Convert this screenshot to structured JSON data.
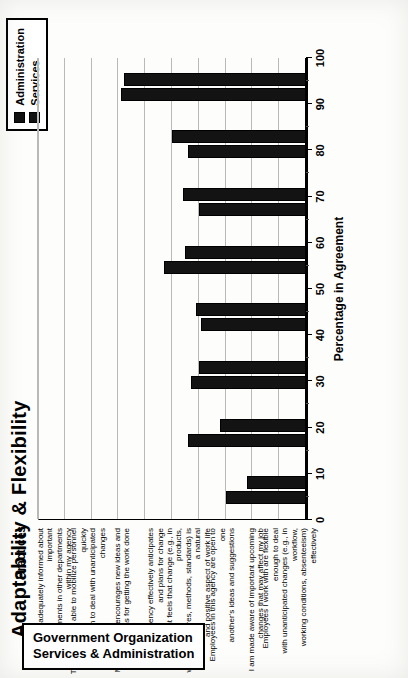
{
  "chart_data": {
    "type": "bar",
    "title": "Adaptability & Flexibility",
    "orientation": "vertical",
    "xlabel": "Practices",
    "ylabel": "Percentage in Agreement",
    "ylim": [
      0,
      100
    ],
    "ytick_step": 10,
    "yticks": [
      0,
      10,
      20,
      30,
      40,
      50,
      60,
      70,
      80,
      90,
      100
    ],
    "grid": true,
    "legend_position": "top-right",
    "categories": [
      "I am adequately informed about important\ndevelopments in other departments within my agency",
      "This agency is able to mobilize personnel quickly\nenough to deal with unanticipated changes",
      "Management encourages new ideas and\nsuggestions for getting the work done",
      "This agency effectively anticipates\nand plans for change",
      "Management feels that change (e.g., in products,\nwork procedures, methods, standards) is a natural\nand positive aspect of work life",
      "Employees in this agency are open to one\nanother's ideas and suggestions",
      "I am made aware of important upcoming\nchanges that may affect my job",
      "Employees I work with are flexible enough to deal\nwith unanticipated changes (e.g., in workflow,\nworking conditions, absenteeism) effectively"
    ],
    "series": [
      {
        "name": "Administration",
        "color": "#131313",
        "values": [
          30,
          44,
          43,
          39,
          53,
          40,
          44,
          69
        ]
      },
      {
        "name": "Services",
        "color": "#131313",
        "values": [
          22,
          32,
          40,
          41,
          45,
          46,
          50,
          68
        ]
      }
    ]
  },
  "legend": {
    "items": [
      {
        "label": "Administration"
      },
      {
        "label": "Services"
      }
    ]
  },
  "footer": {
    "line1": "Government Organization",
    "line2": "Services & Administration"
  }
}
